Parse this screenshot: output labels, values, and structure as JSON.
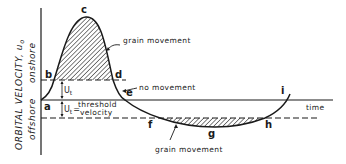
{
  "diagram": {
    "y_axis_label": "ORBITAL VELOCITY, u",
    "y_axis_subscript": "o",
    "onshore_label": "onshore",
    "offshore_label": "offshore",
    "x_axis_label": "time",
    "threshold_label_line1": "threshold",
    "threshold_label_line2": "velocity",
    "threshold_symbol": "U",
    "threshold_subscript": "t",
    "threshold_equals": "=",
    "annotations": {
      "grain_movement_top": "grain movement",
      "no_movement": "no movement",
      "grain_movement_bottom": "grain movement"
    },
    "points": {
      "a": "a",
      "b": "b",
      "c": "c",
      "d": "d",
      "e": "e",
      "f": "f",
      "g": "g",
      "h": "h",
      "i": "i"
    },
    "colors": {
      "ink": "#1a1a1a",
      "background": "#ffffff"
    }
  }
}
